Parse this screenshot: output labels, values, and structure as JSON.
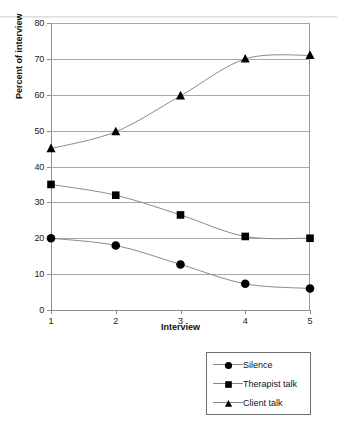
{
  "chart_data": {
    "type": "line",
    "title": "",
    "xlabel": "Interview",
    "ylabel": "Percent of interview",
    "x": [
      1,
      2,
      3,
      4,
      5
    ],
    "xticklabels": [
      "1",
      "2",
      "3",
      "4",
      "5"
    ],
    "yticklabels": [
      "0",
      "10",
      "20",
      "30",
      "40",
      "50",
      "60",
      "70",
      "80"
    ],
    "yticks": [
      0,
      10,
      20,
      30,
      40,
      50,
      60,
      70,
      80
    ],
    "ylim": [
      0,
      80
    ],
    "xlim": [
      1,
      5
    ],
    "grid": "horizontal",
    "legend_position": "bottom-right",
    "series": [
      {
        "name": "Silence",
        "marker": "circle",
        "color": "#000000",
        "values": [
          20,
          18,
          12.7,
          7.3,
          6
        ]
      },
      {
        "name": "Therapist talk",
        "marker": "square",
        "color": "#000000",
        "values": [
          35,
          32,
          26.5,
          20.5,
          20
        ]
      },
      {
        "name": "Client talk",
        "marker": "triangle",
        "color": "#000000",
        "values": [
          45,
          49.7,
          59.7,
          70,
          71
        ]
      }
    ]
  },
  "legend": {
    "items": [
      {
        "label": "Silence",
        "marker": "circle-marker-icon"
      },
      {
        "label": "Therapist talk",
        "marker": "square-marker-icon"
      },
      {
        "label": "Client talk",
        "marker": "triangle-marker-icon"
      }
    ]
  },
  "colors": {
    "axis": "#8e8e8e",
    "grid": "#a8a8a8",
    "line": "#8a8a8a",
    "marker": "#000000",
    "text": "#111111",
    "background": "#ffffff"
  }
}
